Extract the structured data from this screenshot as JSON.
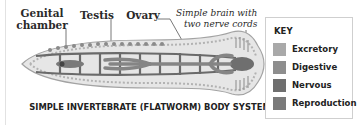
{
  "labels": {
    "genital_chamber": "Genital chamber",
    "genital_line1": "Genital",
    "genital_line2": "chamber",
    "testis": "Testis",
    "ovary": "Ovary",
    "brain_line1": "Simple brain with",
    "brain_line2": "two nerve cords"
  },
  "caption": "SIMPLE INVERTEBRATE (FLATWORM) BODY SYSTEM",
  "key": {
    "title": "KEY",
    "items": [
      {
        "label": "Excretory",
        "color": "#a9a9a9"
      },
      {
        "label": "Digestive",
        "color": "#8e8e8e"
      },
      {
        "label": "Nervous",
        "color": "#6f6f6f"
      },
      {
        "label": "Reproduction",
        "color": "#7a7a7a"
      }
    ]
  },
  "colors": {
    "body_fill": "#e4e4e4",
    "body_outline": "#9a9a9a",
    "gut": "#7d7d7d",
    "nerve": "#6a6a6a",
    "leader_line": "#555555"
  }
}
